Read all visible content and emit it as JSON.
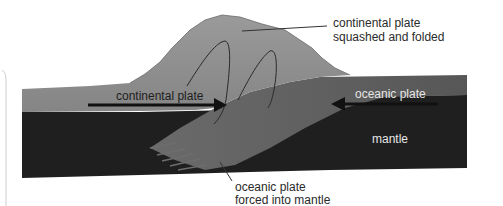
{
  "diagram": {
    "type": "cross-section",
    "colors": {
      "background": "#ffffff",
      "continental_plate": "#8c8c8c",
      "continental_plate_light": "#a2a2a2",
      "oceanic_plate": "#5c5c5c",
      "mantle": "#1f1f1f",
      "fold_lines": "#2a2a2a",
      "arrows": "#111111",
      "leader_lines": "#333333",
      "frame_line": "#c8c8c8"
    },
    "labels": {
      "continental_folded_line1": "continental plate",
      "continental_folded_line2": "squashed and folded",
      "continental_plate": "continental plate",
      "oceanic_plate": "oceanic plate",
      "mantle": "mantle",
      "oceanic_forced_line1": "oceanic plate",
      "oceanic_forced_line2": "forced into mantle"
    },
    "arrows": [
      {
        "name": "continental-plate-arrow",
        "direction": "right"
      },
      {
        "name": "oceanic-plate-arrow",
        "direction": "left"
      }
    ]
  }
}
